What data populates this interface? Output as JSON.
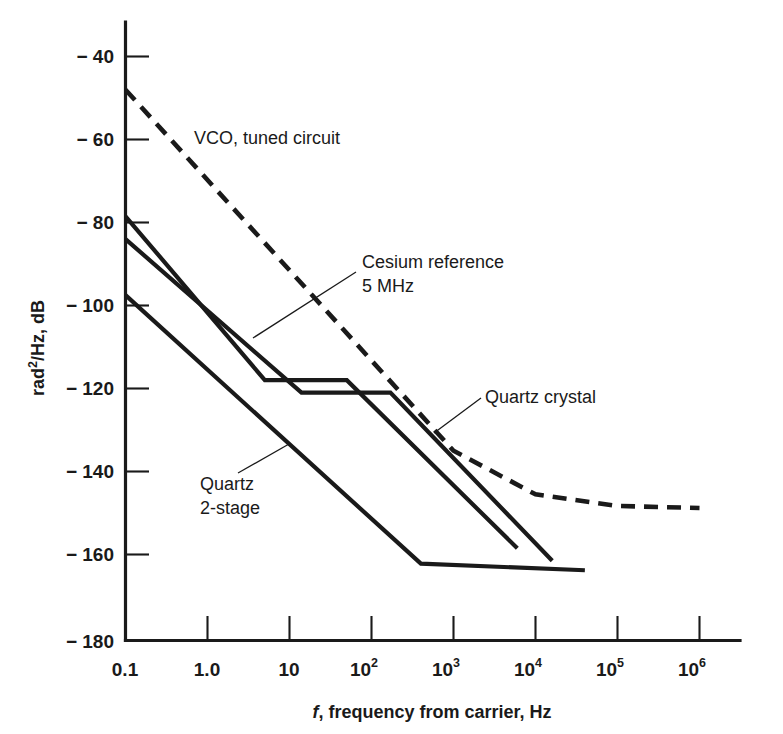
{
  "chart_data": {
    "type": "line",
    "title": "",
    "xlabel": "f, frequency from carrier, Hz",
    "ylabel": "rad2/Hz, dB",
    "xscale": "log",
    "xlim": [
      0.1,
      3000000
    ],
    "ylim": [
      -180,
      -33
    ],
    "grid": false,
    "legend_position": "inline-annotations",
    "xticks": [
      {
        "value": 0.1,
        "label": "0.1"
      },
      {
        "value": 1.0,
        "label": "1.0"
      },
      {
        "value": 10,
        "label": "10"
      },
      {
        "value": 100,
        "label": "10",
        "sup": "2"
      },
      {
        "value": 1000,
        "label": "10",
        "sup": "3"
      },
      {
        "value": 10000,
        "label": "10",
        "sup": "4"
      },
      {
        "value": 100000,
        "label": "10",
        "sup": "5"
      },
      {
        "value": 1000000,
        "label": "10",
        "sup": "6"
      }
    ],
    "yticks": [
      {
        "value": -40,
        "label": "− 40"
      },
      {
        "value": -60,
        "label": "− 60"
      },
      {
        "value": -80,
        "label": "− 80"
      },
      {
        "value": -100,
        "label": "− 100"
      },
      {
        "value": -120,
        "label": "− 120"
      },
      {
        "value": -140,
        "label": "− 140"
      },
      {
        "value": -160,
        "label": "− 160"
      },
      {
        "value": -180,
        "label": "− 180"
      }
    ],
    "series": [
      {
        "name": "VCO, tuned circuit",
        "style": "dashed",
        "color": "#1a1a1a",
        "points": [
          [
            0.1,
            -48
          ],
          [
            1000,
            -135
          ],
          [
            10000,
            -145.5
          ],
          [
            100000,
            -148.3
          ],
          [
            1000000,
            -148.8
          ]
        ]
      },
      {
        "name": "Cesium reference 5 MHz",
        "style": "solid",
        "color": "#1a1a1a",
        "points": [
          [
            0.1,
            -78.5
          ],
          [
            5.0,
            -118
          ],
          [
            50,
            -118
          ],
          [
            6000,
            -158.5
          ]
        ]
      },
      {
        "name": "Quartz crystal",
        "style": "solid",
        "color": "#1a1a1a",
        "points": [
          [
            0.1,
            -84
          ],
          [
            14,
            -121
          ],
          [
            170,
            -121
          ],
          [
            16000,
            -161.5
          ]
        ]
      },
      {
        "name": "Quartz 2-stage",
        "style": "solid",
        "color": "#1a1a1a",
        "points": [
          [
            0.1,
            -97.5
          ],
          [
            400,
            -162.2
          ],
          [
            40000,
            -163.8
          ]
        ]
      }
    ],
    "annotations": [
      {
        "id": "vco-label",
        "text": "VCO, tuned circuit",
        "x": 194,
        "y": 144,
        "leader": null
      },
      {
        "id": "cesium-label",
        "text_line1": "Cesium reference",
        "text_line2": "5 MHz",
        "x": 362,
        "y": 268,
        "leader": [
          [
            356,
            272
          ],
          [
            253,
            338
          ]
        ]
      },
      {
        "id": "quartz-crystal-label",
        "text": "Quartz crystal",
        "x": 485,
        "y": 403,
        "leader": [
          [
            481,
            398
          ],
          [
            434,
            433
          ]
        ]
      },
      {
        "id": "quartz-2stage-label",
        "text_line1": "Quartz",
        "text_line2": "2-stage",
        "x": 200,
        "y": 490,
        "leader": [
          [
            238,
            473
          ],
          [
            289,
            444
          ]
        ]
      }
    ]
  },
  "axes": {
    "y_label_main": "rad",
    "y_label_sup": "2",
    "y_label_rest": "/Hz, dB",
    "x_label_italic": "f",
    "x_label_rest": ", frequency from carrier, Hz"
  }
}
